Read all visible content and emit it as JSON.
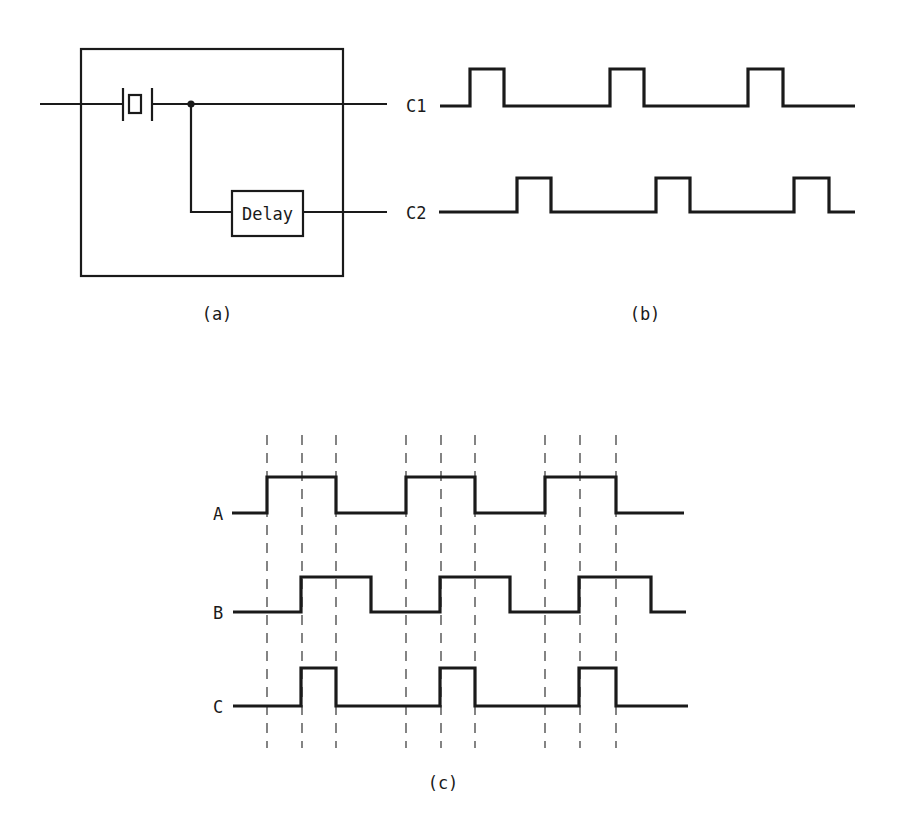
{
  "panel_a": {
    "caption": "(a)",
    "delay_label": "Delay",
    "components": [
      "crystal-oscillator",
      "junction-dot",
      "delay-block",
      "enclosure-box"
    ]
  },
  "panel_b": {
    "caption": "(b)",
    "signals": [
      {
        "name": "C1",
        "label": "C1"
      },
      {
        "name": "C2",
        "label": "C2"
      }
    ]
  },
  "panel_c": {
    "caption": "(c)",
    "signals": [
      {
        "name": "A",
        "label": "A"
      },
      {
        "name": "B",
        "label": "B"
      },
      {
        "name": "C",
        "label": "C"
      }
    ],
    "dashed_guides": 9
  },
  "colors": {
    "ink": "#1a1a1a",
    "background": "#ffffff"
  }
}
